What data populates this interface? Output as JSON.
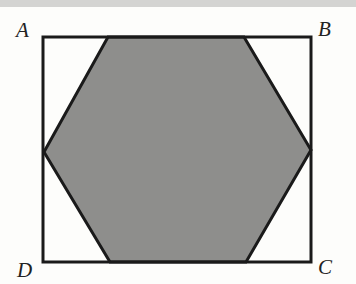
{
  "diagram": {
    "labels": {
      "A": "A",
      "B": "B",
      "C": "C",
      "D": "D"
    },
    "rectangle": {
      "x1": 43,
      "y1": 37,
      "x2": 311,
      "y2": 262
    },
    "hexagon": [
      [
        108,
        37
      ],
      [
        244,
        37
      ],
      [
        311,
        150
      ],
      [
        246,
        262
      ],
      [
        110,
        262
      ],
      [
        44,
        152
      ]
    ],
    "colors": {
      "shade": "#8e8e8c",
      "stroke": "#1a1a1a",
      "background": "#fdfdfb"
    }
  }
}
